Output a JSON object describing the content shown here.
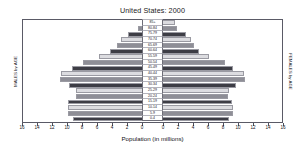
{
  "chart_data": {
    "type": "bar",
    "subtype": "population-pyramid",
    "title": "United States: 2000",
    "xlabel": "Population (in millions)",
    "ylabel_left": "MALES by AGE",
    "ylabel_right": "FEMALES by AGE",
    "grid": false,
    "legend": "none",
    "axis_max": 16,
    "xticks_left": [
      "16",
      "14",
      "12",
      "10",
      "8",
      "6",
      "4",
      "2",
      "0"
    ],
    "xticks_right": [
      "0",
      "2",
      "4",
      "6",
      "8",
      "10",
      "12",
      "14",
      "16"
    ],
    "xtick_values": [
      0,
      2,
      4,
      6,
      8,
      10,
      12,
      14,
      16
    ],
    "categories": [
      "0-4",
      "5-9",
      "10-14",
      "15-19",
      "20-24",
      "25-29",
      "30-34",
      "35-39",
      "40-44",
      "45-49",
      "50-54",
      "55-59",
      "60-64",
      "65-69",
      "70-74",
      "75-79",
      "80-84",
      "85+"
    ],
    "series": [
      {
        "name": "MALES by AGE",
        "side": "left",
        "values": [
          9.8,
          10.5,
          10.5,
          10.4,
          9.4,
          9.5,
          10.3,
          11.4,
          11.3,
          9.9,
          8.6,
          6.6,
          5.3,
          4.4,
          3.9,
          3.0,
          1.8,
          1.2
        ]
      },
      {
        "name": "FEMALES by AGE",
        "side": "right",
        "values": [
          9.4,
          10.0,
          10.0,
          9.8,
          9.3,
          9.5,
          10.3,
          11.4,
          11.3,
          10.0,
          8.9,
          7.0,
          5.8,
          5.1,
          4.8,
          4.1,
          3.0,
          2.8
        ]
      }
    ],
    "colors": {
      "dark": "#3d3d45",
      "medium": "#8e8e96",
      "light": "#dcdce0",
      "frame": "#5a5a66",
      "background": "#ffffff",
      "text": "#15151a"
    }
  }
}
